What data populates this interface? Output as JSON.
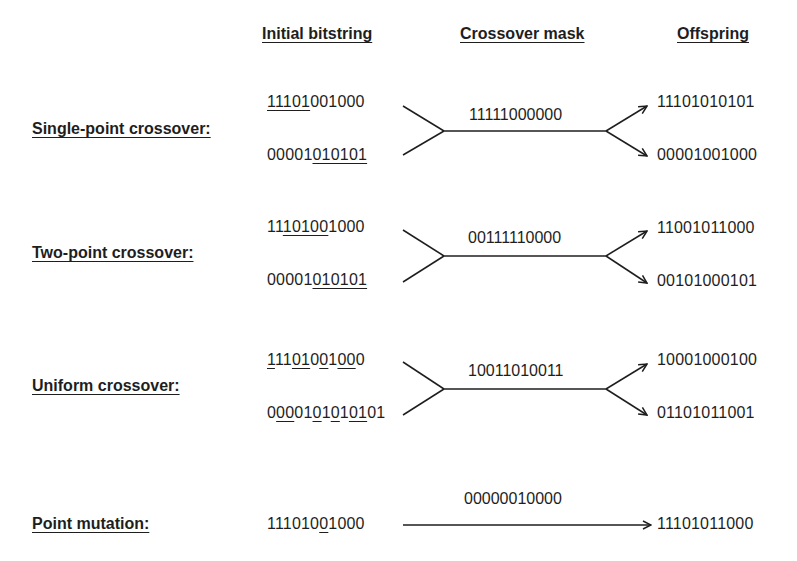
{
  "headers": {
    "initial": "Initial bitstring",
    "mask": "Crossover mask",
    "offspring": "Offspring"
  },
  "rows": [
    {
      "label": "Single-point crossover:",
      "parent1": [
        {
          "t": "11101",
          "u": true
        },
        {
          "t": "001000",
          "u": false
        }
      ],
      "parent2": [
        {
          "t": "00001",
          "u": false
        },
        {
          "t": "010101",
          "u": true
        }
      ],
      "mask": "11111000000",
      "child1": "11101010101",
      "child2": "00001001000"
    },
    {
      "label": "Two-point crossover:",
      "parent1": [
        {
          "t": "11",
          "u": false
        },
        {
          "t": "10100",
          "u": true
        },
        {
          "t": "1000",
          "u": false
        }
      ],
      "parent2": [
        {
          "t": "00001",
          "u": false
        },
        {
          "t": "010101",
          "u": true
        }
      ],
      "mask": "00111110000",
      "child1": "11001011000",
      "child2": "00101000101"
    },
    {
      "label": "Uniform crossover:",
      "parent1": [
        {
          "t": "1",
          "u": true
        },
        {
          "t": "11",
          "u": false
        },
        {
          "t": "01",
          "u": true
        },
        {
          "t": "0",
          "u": false
        },
        {
          "t": "0",
          "u": true
        },
        {
          "t": "1",
          "u": false
        },
        {
          "t": "00",
          "u": true
        },
        {
          "t": "0",
          "u": false
        }
      ],
      "parent2": [
        {
          "t": "0",
          "u": false
        },
        {
          "t": "00",
          "u": true
        },
        {
          "t": "01",
          "u": false
        },
        {
          "t": "0",
          "u": true
        },
        {
          "t": "1",
          "u": false
        },
        {
          "t": "0",
          "u": true
        },
        {
          "t": "1",
          "u": false
        },
        {
          "t": "01",
          "u": true
        },
        {
          "t": "01",
          "u": false
        }
      ],
      "mask": "10011010011",
      "child1": "10001000100",
      "child2": "01101011001"
    },
    {
      "label": "Point mutation:",
      "parent1": [
        {
          "t": "111010",
          "u": false
        },
        {
          "t": "0",
          "u": true
        },
        {
          "t": "1000",
          "u": false
        }
      ],
      "mask": "00000010000",
      "child1": "11101011000"
    }
  ]
}
